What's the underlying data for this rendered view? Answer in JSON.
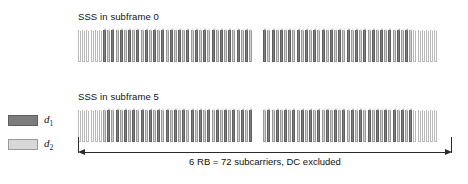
{
  "figure": {
    "rows": [
      {
        "id": "sf0",
        "label": "SSS in subframe 0"
      },
      {
        "id": "sf5",
        "label": "SSS in subframe 5"
      }
    ],
    "legend": {
      "items": [
        {
          "symbol": "d",
          "subscript": "1",
          "swatch_name": "d1-swatch",
          "color": "#7d7d7d"
        },
        {
          "symbol": "d",
          "subscript": "2",
          "swatch_name": "d2-swatch",
          "color": "#d8d8d8"
        }
      ]
    },
    "dimension": {
      "caption": "6 RB = 72 subcarriers, DC excluded",
      "resource_blocks": 6,
      "subcarriers": 72,
      "dc_excluded": true
    },
    "comb": {
      "total_teeth_per_row": 84,
      "teeth_per_half": 42,
      "empty_teeth_each_edge": 6,
      "gap_name": "dc-gap",
      "colors": {
        "d1": "#7d7d7d",
        "d2": "#cfcfcf",
        "empty": "#ffffff"
      },
      "patterns": {
        "sf0": [
          "d1",
          "d2"
        ],
        "sf5": [
          "d2",
          "d1"
        ]
      }
    }
  }
}
